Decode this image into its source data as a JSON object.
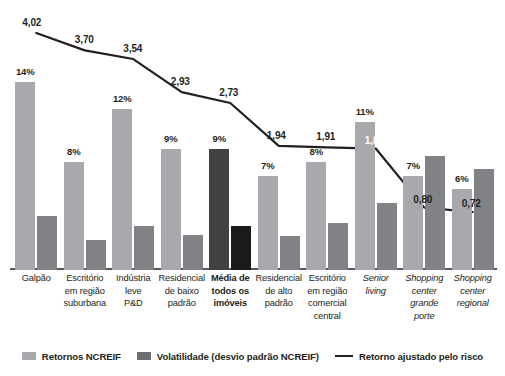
{
  "chart_data": {
    "type": "bar",
    "title": "",
    "xlabel": "",
    "ylabel": "",
    "grid": false,
    "legend_position": "bottom",
    "categories": [
      "Galpão",
      "Escritório em região suburbana",
      "Indústria leve P&D",
      "Residencial de baixo padrão",
      "Média de todos os imóveis",
      "Residencial de alto padrão",
      "Escritório em região comercial central",
      "Senior living",
      "Shopping center grande porte",
      "Shopping center regional"
    ],
    "category_lines": [
      [
        "Galpão"
      ],
      [
        "Escritório",
        "em região",
        "suburbana"
      ],
      [
        "Indústria",
        "leve",
        "P&D"
      ],
      [
        "Residencial",
        "de baixo",
        "padrão"
      ],
      [
        "Média de",
        "todos os",
        "imóveis"
      ],
      [
        "Residencial",
        "de alto",
        "padrão"
      ],
      [
        "Escritório",
        "em região",
        "comercial",
        "central"
      ],
      [
        "Senior",
        "living"
      ],
      [
        "Shopping",
        "center",
        "grande",
        "porte"
      ],
      [
        "Shopping",
        "center",
        "regional"
      ]
    ],
    "series": [
      {
        "name": "Retornos NCREIF",
        "type": "bar",
        "color": "#a7a9ac",
        "values": [
          14,
          8,
          12,
          9,
          9,
          7,
          8,
          11,
          7,
          6
        ],
        "labels": [
          "14%",
          "8%",
          "12%",
          "9%",
          "9%",
          "7%",
          "8%",
          "11%",
          "7%",
          "6%"
        ]
      },
      {
        "name": "Volatilidade (desvio padrão NCREIF)",
        "type": "bar",
        "color": "#808285",
        "values": [
          4.0,
          2.2,
          3.3,
          2.6,
          3.3,
          2.5,
          3.5,
          5.0,
          8.5,
          7.5
        ],
        "labels": [
          "",
          "",
          "",
          "",
          "",
          "",
          "",
          "",
          "",
          ""
        ]
      },
      {
        "name": "Retorno ajustado pelo risco",
        "type": "line",
        "color": "#231f20",
        "values": [
          4.02,
          3.7,
          3.54,
          2.93,
          2.73,
          1.94,
          1.91,
          1.89,
          0.8,
          0.72
        ],
        "labels": [
          "4,02",
          "3,70",
          "3,54",
          "2,93",
          "2,73",
          "1,94",
          "1,91",
          "1,89",
          "0,80",
          "0,72"
        ]
      }
    ],
    "highlight_category_index": 4,
    "ylim": [
      0,
      16
    ]
  },
  "legend": {
    "items": [
      {
        "label": "Retornos NCREIF",
        "marker": "swatch-light-gray"
      },
      {
        "label": "Volatilidade (desvio padrão NCREIF)",
        "marker": "swatch-dark-gray"
      },
      {
        "label": "Retorno ajustado pelo risco",
        "marker": "line-black"
      }
    ]
  },
  "colors": {
    "returns_bar": "#a7a9ac",
    "volatility_bar": "#808285",
    "highlight_returns_bar": "#414042",
    "highlight_volatility_bar": "#1a1a1a",
    "line": "#231f20",
    "axis": "#58595b",
    "background": "#ffffff"
  }
}
